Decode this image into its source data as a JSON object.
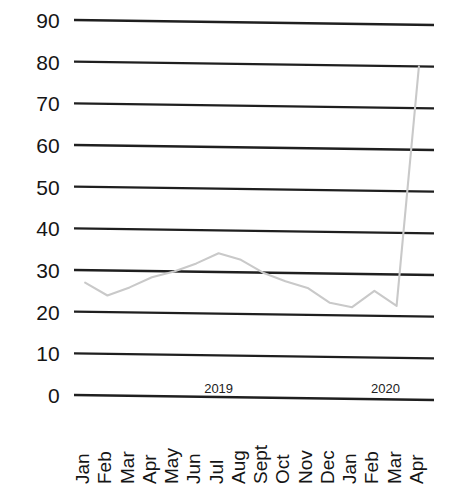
{
  "chart_data": {
    "type": "line",
    "title": "",
    "xlabel": "",
    "ylabel": "",
    "ylim": [
      0,
      90
    ],
    "ytick_step": 10,
    "grid": true,
    "legend": "none",
    "line_color": "#c9c9c9",
    "grid_color": "#1f1f1f",
    "axis_text_color": "#151515",
    "y_ticks": [
      "90",
      "80",
      "70",
      "60",
      "50",
      "40",
      "30",
      "20",
      "10",
      "0"
    ],
    "y_tick_values": [
      90,
      80,
      70,
      60,
      50,
      40,
      30,
      20,
      10,
      0
    ],
    "categories": [
      "Jan",
      "Feb",
      "Mar",
      "Apr",
      "May",
      "Jun",
      "Jul",
      "Aug",
      "Sept",
      "Oct",
      "Nov",
      "Dec",
      "Jan",
      "Feb",
      "Mar",
      "Apr"
    ],
    "values": [
      27,
      24,
      26,
      28.5,
      30,
      32,
      34.5,
      33,
      30,
      28,
      26.5,
      23,
      22,
      26,
      22.5,
      80
    ],
    "group_labels": [
      {
        "text": "2019",
        "center_index": 6
      },
      {
        "text": "2020",
        "center_index": 13.5
      }
    ]
  }
}
